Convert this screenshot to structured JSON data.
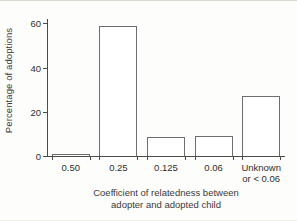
{
  "chart_data": {
    "type": "bar",
    "title": "",
    "xlabel": "Coefficient of relatedness between adopter and adopted child",
    "xlabel_line1": "Coefficient of relatedness between",
    "xlabel_line2": "adopter and adopted child",
    "ylabel": "Percentage of adoptions",
    "categories": [
      "0.50",
      "0.25",
      "0.125",
      "0.06",
      "Unknown or < 0.06"
    ],
    "category_lines": [
      {
        "line1": "0.50",
        "line2": ""
      },
      {
        "line1": "0.25",
        "line2": ""
      },
      {
        "line1": "0.125",
        "line2": ""
      },
      {
        "line1": "0.06",
        "line2": ""
      },
      {
        "line1": "Unknown",
        "line2": "or < 0.06"
      }
    ],
    "values": [
      1,
      59,
      8.5,
      9,
      27
    ],
    "ylim": [
      0,
      62
    ],
    "yticks": [
      0,
      20,
      40,
      60
    ],
    "ytick_labels": [
      "0",
      "20",
      "40",
      "60"
    ],
    "grid": false,
    "legend": "none",
    "bar_fill": "#ffffff",
    "bar_edge": "#6e6e6e",
    "axis_color": "#4b4b4b",
    "background": "#fdfdfb"
  }
}
